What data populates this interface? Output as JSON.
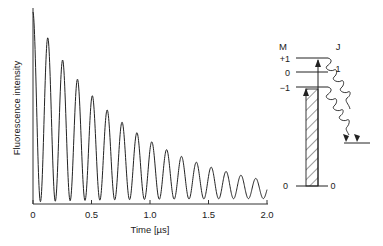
{
  "chart_data": {
    "type": "line",
    "title": "",
    "xlabel": "Time [µs]",
    "ylabel": "Fluorescence intensity",
    "xlim": [
      0,
      2.0
    ],
    "x_ticks": [
      "0",
      "0.5",
      "1.0",
      "1.5",
      "2.0"
    ],
    "x_tick_values": [
      0,
      0.5,
      1.0,
      1.5,
      2.0
    ],
    "y_ticks": [],
    "grid": false,
    "legend": null,
    "series": [
      {
        "name": "Fluorescence intensity",
        "oscillation_period_us": 0.127,
        "peak_times_us": [
          0.0,
          0.127,
          0.254,
          0.381,
          0.508,
          0.635,
          0.762,
          0.889,
          1.016,
          1.143,
          1.27,
          1.397,
          1.524,
          1.651,
          1.778,
          1.905
        ],
        "peak_values_relative": [
          1.0,
          0.81,
          0.68,
          0.57,
          0.48,
          0.41,
          0.34,
          0.29,
          0.24,
          0.2,
          0.17,
          0.14,
          0.12,
          0.1,
          0.09,
          0.08
        ]
      }
    ]
  },
  "diagram": {
    "m_header": "M",
    "j_header": "J",
    "upper_levels": [
      "+1",
      "0",
      "−1"
    ],
    "j_upper": "1",
    "ground_m": "0",
    "ground_j": "0"
  }
}
